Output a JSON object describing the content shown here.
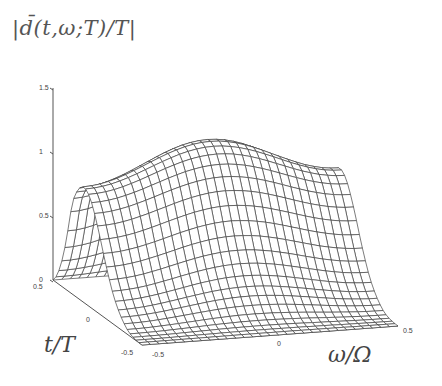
{
  "chart_data": {
    "type": "surface3d",
    "xlabel": "ω/Ω",
    "ylabel": "t/T",
    "zlabel": "",
    "x_range": [
      -0.5,
      0.5
    ],
    "y_range": [
      -0.5,
      0.5
    ],
    "zlim": [
      0,
      1.5
    ],
    "x_ticks": [
      "-0.5",
      "0",
      "0.5"
    ],
    "y_ticks": [
      "-0.5",
      "0",
      "0.5"
    ],
    "z_ticks": [
      "0",
      "0.5",
      "1",
      "1.5"
    ],
    "grid": false,
    "style": "wireframe mesh"
  },
  "labels": {
    "title": "|d̄(t,ω;T)/T|",
    "t_axis": "t/T",
    "w_axis": "ω/Ω"
  }
}
